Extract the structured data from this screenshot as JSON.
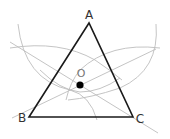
{
  "diagram": {
    "type": "geometric-construction",
    "vertices": [
      {
        "label": "A",
        "x": 89,
        "y": 23
      },
      {
        "label": "B",
        "x": 29,
        "y": 117
      },
      {
        "label": "C",
        "x": 133,
        "y": 117
      }
    ],
    "center_point": {
      "label": "O",
      "x": 80,
      "y": 85
    },
    "colors": {
      "triangle": "#1a1a1a",
      "construction": "#b8b8b8",
      "point": "#000000",
      "label": "#333333"
    }
  }
}
